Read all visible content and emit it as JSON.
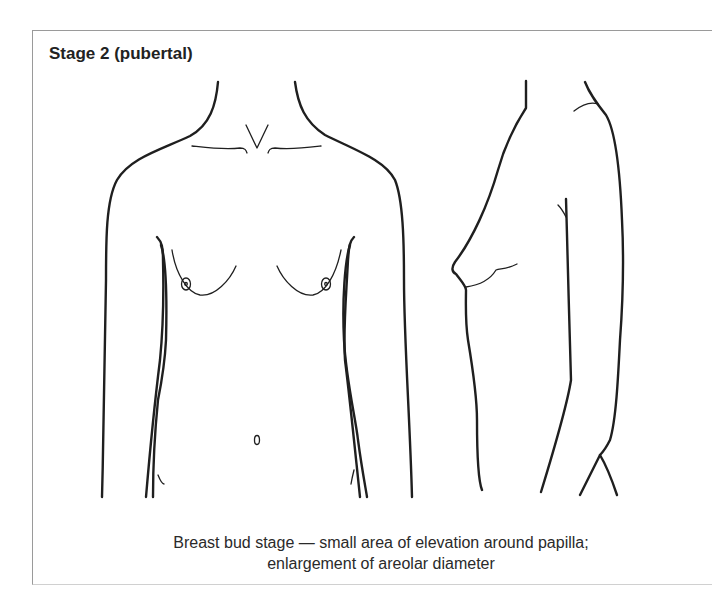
{
  "diagram": {
    "title": "Stage 2 (pubertal)",
    "caption_lines": [
      "Breast bud stage — small area of elevation around papilla;",
      "enlargement of areolar diameter"
    ],
    "figures": [
      {
        "name": "front-view",
        "description": "Anterior view of torso"
      },
      {
        "name": "side-view",
        "description": "Lateral profile view of torso"
      }
    ]
  }
}
